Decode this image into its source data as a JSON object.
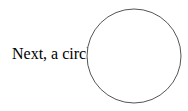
{
  "content": {
    "label": "Next, a circle:",
    "circle": {
      "cx": 48,
      "cy": 48,
      "r": 47,
      "stroke": "#555555",
      "fill": "#ffffff"
    }
  }
}
